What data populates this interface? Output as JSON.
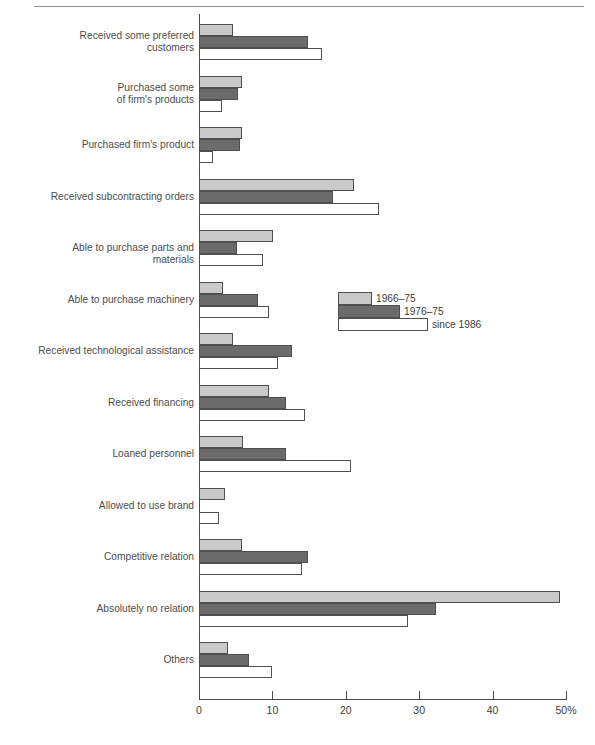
{
  "chart_data": {
    "type": "bar",
    "orientation": "horizontal",
    "title": "",
    "xlabel": "",
    "ylabel": "",
    "xlim": [
      0,
      50
    ],
    "xticks": [
      0,
      10,
      20,
      30,
      40,
      50
    ],
    "xtick_labels": [
      "0",
      "10",
      "20",
      "30",
      "40",
      "50%"
    ],
    "grid": false,
    "legend_position": "middle-right",
    "categories": [
      "Received some preferred\ncustomers",
      "Purchased some\nof firm's products",
      "Purchased firm's product",
      "Received subcontracting orders",
      "Able to purchase parts and materials",
      "Able to purchase machinery",
      "Received technological assistance",
      "Received financing",
      "Loaned personnel",
      "Allowed to use brand",
      "Competitive relation",
      "Absolutely no relation",
      "Others"
    ],
    "series": [
      {
        "name": "1966–75",
        "color": "#c9c9c9",
        "values": [
          4.6,
          5.9,
          5.9,
          21.1,
          10.1,
          3.3,
          4.6,
          9.5,
          6.0,
          3.6,
          5.9,
          49.2,
          3.9
        ]
      },
      {
        "name": "1976–75",
        "color": "#6b6b6b",
        "values": [
          14.9,
          5.3,
          5.6,
          18.3,
          5.2,
          8.0,
          12.7,
          11.9,
          11.9,
          0,
          14.9,
          32.3,
          6.8
        ]
      },
      {
        "name": "since 1986",
        "color": "#ffffff",
        "values": [
          16.8,
          3.1,
          1.9,
          24.5,
          8.7,
          9.5,
          10.8,
          14.4,
          20.7,
          2.7,
          14.0,
          28.5,
          10.0
        ]
      }
    ]
  },
  "legend": {
    "entries": [
      {
        "label": "1966–75"
      },
      {
        "label": "1976–75"
      },
      {
        "label": "since 1986"
      }
    ]
  },
  "axis": {
    "tick_labels": [
      "0",
      "10",
      "20",
      "30",
      "40",
      "50%"
    ]
  },
  "colors": {
    "series_1": "#c9c9c9",
    "series_2": "#6b6b6b",
    "series_3": "#ffffff",
    "outline": "#4f4f4f",
    "text": "#3c3c3c"
  }
}
